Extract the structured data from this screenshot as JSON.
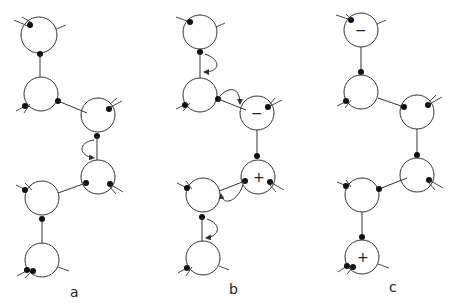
{
  "figure": {
    "panels": [
      {
        "id": "a",
        "label": "a"
      },
      {
        "id": "b",
        "label": "b",
        "signs": {
          "upper": "−",
          "lower": "+"
        }
      },
      {
        "id": "c",
        "label": "c",
        "signs": {
          "top": "−",
          "bottom": "+"
        }
      }
    ]
  }
}
